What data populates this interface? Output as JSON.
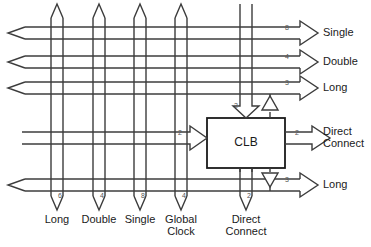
{
  "diagram": {
    "block": {
      "label": "CLB"
    },
    "colors": {
      "line": "#3c3c3c",
      "outline": "#1a1a1a",
      "text": "#1a1a1a",
      "background": "#ffffff"
    },
    "right_ports": [
      {
        "name": "single-out",
        "label": "Single",
        "width": "8",
        "y": 33
      },
      {
        "name": "double-out",
        "label": "Double",
        "width": "4",
        "y": 62
      },
      {
        "name": "long-out-top",
        "label": "Long",
        "width": "3",
        "y": 88
      },
      {
        "name": "direct-connect-out",
        "label": "Direct\nConnect",
        "width": "2",
        "y": 138
      },
      {
        "name": "long-out-bottom",
        "label": "Long",
        "width": "3",
        "y": 185
      }
    ],
    "bottom_ports": [
      {
        "name": "long-bus",
        "label": "Long",
        "width": "6",
        "x": 57
      },
      {
        "name": "double-bus",
        "label": "Double",
        "width": "4",
        "x": 99
      },
      {
        "name": "single-bus",
        "label": "Single",
        "width": "8",
        "x": 140
      },
      {
        "name": "global-clock-bus",
        "label": "Global\nClock",
        "width": "4",
        "x": 181
      },
      {
        "name": "direct-connect-in",
        "label": "Direct\nConnect",
        "width": "2",
        "x": 246
      }
    ],
    "clb_ports": [
      {
        "name": "clb-top-input",
        "width": "2"
      },
      {
        "name": "clb-left-input",
        "width": "2"
      },
      {
        "name": "clb-right-output",
        "width": "2"
      }
    ],
    "buffers": [
      {
        "name": "tristate-buffer-top",
        "direction": "up"
      },
      {
        "name": "tristate-buffer-bottom",
        "direction": "down"
      }
    ]
  }
}
